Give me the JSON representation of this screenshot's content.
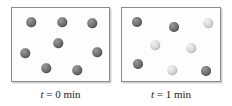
{
  "figure": {
    "kind": "particulate-level-diagram",
    "background_color": "#ffffff"
  },
  "colors": {
    "sphere_dark": "#6f6f6f",
    "sphere_light": "#d3d3d3",
    "panel_border": "#8b8b8b",
    "panel_fill": "#fdfdfd",
    "caption_text": "#1a1a1a"
  },
  "panels": [
    {
      "id": "panel-t0",
      "caption": {
        "variable": "t",
        "equals": " = ",
        "value": "0 min",
        "full": "t = 0 min"
      },
      "counts": {
        "dark": 8,
        "light": 0,
        "total": 8
      },
      "spheres": [
        {
          "type": "dark",
          "x": 19,
          "y": 14,
          "d": 9.5
        },
        {
          "type": "dark",
          "x": 50,
          "y": 14,
          "d": 9.5
        },
        {
          "type": "dark",
          "x": 80,
          "y": 15,
          "d": 9.5
        },
        {
          "type": "dark",
          "x": 46,
          "y": 35,
          "d": 9.5
        },
        {
          "type": "dark",
          "x": 13,
          "y": 45,
          "d": 9.5
        },
        {
          "type": "dark",
          "x": 85,
          "y": 44,
          "d": 9.5
        },
        {
          "type": "dark",
          "x": 34,
          "y": 60,
          "d": 9.5
        },
        {
          "type": "dark",
          "x": 65,
          "y": 62,
          "d": 9.5
        }
      ]
    },
    {
      "id": "panel-t1",
      "caption": {
        "variable": "t",
        "equals": " = ",
        "value": "1 min",
        "full": "t = 1 min"
      },
      "counts": {
        "dark": 4,
        "light": 4,
        "total": 8
      },
      "spheres": [
        {
          "type": "dark",
          "x": 15,
          "y": 14,
          "d": 10
        },
        {
          "type": "dark",
          "x": 52,
          "y": 19,
          "d": 10
        },
        {
          "type": "light",
          "x": 86,
          "y": 15,
          "d": 9.5
        },
        {
          "type": "light",
          "x": 33,
          "y": 37,
          "d": 9.5
        },
        {
          "type": "light",
          "x": 69,
          "y": 40,
          "d": 9.5
        },
        {
          "type": "dark",
          "x": 16,
          "y": 56,
          "d": 10
        },
        {
          "type": "light",
          "x": 50,
          "y": 62,
          "d": 9.5
        },
        {
          "type": "dark",
          "x": 84,
          "y": 63,
          "d": 10
        }
      ]
    }
  ]
}
